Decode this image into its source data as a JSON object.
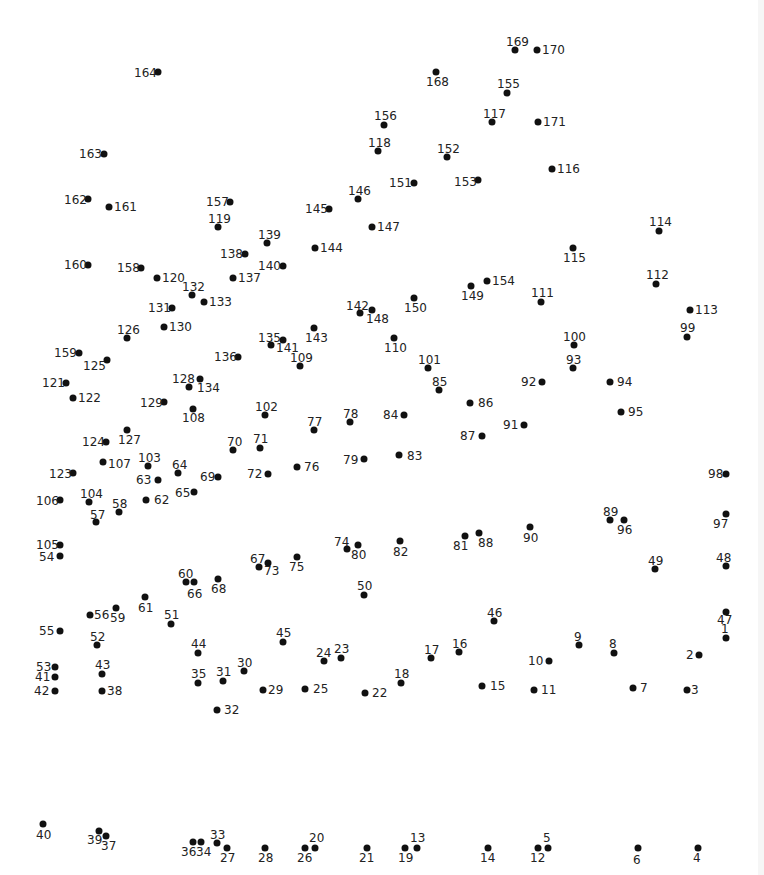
{
  "puzzle": {
    "type": "connect-the-dots",
    "dot_color": "#111111",
    "label_color": "#222222",
    "background": "#ffffff",
    "points": [
      {
        "n": "1",
        "x": 726,
        "y": 638,
        "lx": 721,
        "ly": 623
      },
      {
        "n": "2",
        "x": 699,
        "y": 655,
        "lx": 686,
        "ly": 649
      },
      {
        "n": "3",
        "x": 687,
        "y": 690,
        "lx": 691,
        "ly": 684
      },
      {
        "n": "4",
        "x": 698,
        "y": 848,
        "lx": 693,
        "ly": 852
      },
      {
        "n": "5",
        "x": 548,
        "y": 848,
        "lx": 543,
        "ly": 832
      },
      {
        "n": "6",
        "x": 638,
        "y": 848,
        "lx": 633,
        "ly": 854
      },
      {
        "n": "7",
        "x": 633,
        "y": 688,
        "lx": 640,
        "ly": 682
      },
      {
        "n": "8",
        "x": 614,
        "y": 653,
        "lx": 609,
        "ly": 638
      },
      {
        "n": "9",
        "x": 579,
        "y": 645,
        "lx": 574,
        "ly": 631
      },
      {
        "n": "10",
        "x": 549,
        "y": 661,
        "lx": 528,
        "ly": 655
      },
      {
        "n": "11",
        "x": 534,
        "y": 690,
        "lx": 541,
        "ly": 684
      },
      {
        "n": "12",
        "x": 538,
        "y": 848,
        "lx": 530,
        "ly": 852
      },
      {
        "n": "13",
        "x": 417,
        "y": 848,
        "lx": 410,
        "ly": 832
      },
      {
        "n": "14",
        "x": 488,
        "y": 848,
        "lx": 480,
        "ly": 852
      },
      {
        "n": "15",
        "x": 482,
        "y": 686,
        "lx": 490,
        "ly": 680
      },
      {
        "n": "16",
        "x": 459,
        "y": 652,
        "lx": 452,
        "ly": 638
      },
      {
        "n": "17",
        "x": 431,
        "y": 658,
        "lx": 424,
        "ly": 644
      },
      {
        "n": "18",
        "x": 401,
        "y": 683,
        "lx": 394,
        "ly": 668
      },
      {
        "n": "19",
        "x": 405,
        "y": 848,
        "lx": 398,
        "ly": 852
      },
      {
        "n": "20",
        "x": 315,
        "y": 848,
        "lx": 309,
        "ly": 832
      },
      {
        "n": "21",
        "x": 367,
        "y": 848,
        "lx": 359,
        "ly": 852
      },
      {
        "n": "22",
        "x": 365,
        "y": 693,
        "lx": 372,
        "ly": 687
      },
      {
        "n": "23",
        "x": 341,
        "y": 658,
        "lx": 334,
        "ly": 643
      },
      {
        "n": "24",
        "x": 324,
        "y": 661,
        "lx": 316,
        "ly": 647
      },
      {
        "n": "25",
        "x": 305,
        "y": 689,
        "lx": 313,
        "ly": 683
      },
      {
        "n": "26",
        "x": 305,
        "y": 848,
        "lx": 297,
        "ly": 852
      },
      {
        "n": "27",
        "x": 227,
        "y": 848,
        "lx": 220,
        "ly": 852
      },
      {
        "n": "28",
        "x": 265,
        "y": 848,
        "lx": 258,
        "ly": 852
      },
      {
        "n": "29",
        "x": 263,
        "y": 690,
        "lx": 268,
        "ly": 684
      },
      {
        "n": "30",
        "x": 244,
        "y": 671,
        "lx": 237,
        "ly": 657
      },
      {
        "n": "31",
        "x": 223,
        "y": 681,
        "lx": 216,
        "ly": 666
      },
      {
        "n": "32",
        "x": 217,
        "y": 710,
        "lx": 224,
        "ly": 704
      },
      {
        "n": "33",
        "x": 217,
        "y": 843,
        "lx": 210,
        "ly": 829
      },
      {
        "n": "34",
        "x": 201,
        "y": 842,
        "lx": 196,
        "ly": 846
      },
      {
        "n": "35",
        "x": 198,
        "y": 683,
        "lx": 191,
        "ly": 668
      },
      {
        "n": "36",
        "x": 193,
        "y": 842,
        "lx": 181,
        "ly": 846
      },
      {
        "n": "37",
        "x": 106,
        "y": 836,
        "lx": 101,
        "ly": 840
      },
      {
        "n": "38",
        "x": 102,
        "y": 691,
        "lx": 107,
        "ly": 685
      },
      {
        "n": "39",
        "x": 99,
        "y": 831,
        "lx": 87,
        "ly": 834
      },
      {
        "n": "40",
        "x": 43,
        "y": 824,
        "lx": 36,
        "ly": 829
      },
      {
        "n": "41",
        "x": 55,
        "y": 677,
        "lx": 35,
        "ly": 671
      },
      {
        "n": "42",
        "x": 55,
        "y": 691,
        "lx": 34,
        "ly": 685
      },
      {
        "n": "43",
        "x": 102,
        "y": 674,
        "lx": 95,
        "ly": 659
      },
      {
        "n": "44",
        "x": 198,
        "y": 653,
        "lx": 191,
        "ly": 638
      },
      {
        "n": "45",
        "x": 283,
        "y": 642,
        "lx": 276,
        "ly": 627
      },
      {
        "n": "46",
        "x": 494,
        "y": 621,
        "lx": 487,
        "ly": 607
      },
      {
        "n": "47",
        "x": 726,
        "y": 612,
        "lx": 717,
        "ly": 614
      },
      {
        "n": "48",
        "x": 726,
        "y": 566,
        "lx": 716,
        "ly": 552
      },
      {
        "n": "49",
        "x": 655,
        "y": 569,
        "lx": 648,
        "ly": 555
      },
      {
        "n": "50",
        "x": 364,
        "y": 595,
        "lx": 357,
        "ly": 580
      },
      {
        "n": "51",
        "x": 171,
        "y": 624,
        "lx": 164,
        "ly": 609
      },
      {
        "n": "52",
        "x": 97,
        "y": 645,
        "lx": 90,
        "ly": 631
      },
      {
        "n": "53",
        "x": 55,
        "y": 667,
        "lx": 36,
        "ly": 661
      },
      {
        "n": "54",
        "x": 60,
        "y": 556,
        "lx": 39,
        "ly": 551
      },
      {
        "n": "55",
        "x": 60,
        "y": 631,
        "lx": 39,
        "ly": 625
      },
      {
        "n": "56",
        "x": 90,
        "y": 615,
        "lx": 94,
        "ly": 609
      },
      {
        "n": "57",
        "x": 96,
        "y": 522,
        "lx": 90,
        "ly": 509
      },
      {
        "n": "58",
        "x": 119,
        "y": 512,
        "lx": 112,
        "ly": 498
      },
      {
        "n": "59",
        "x": 116,
        "y": 608,
        "lx": 110,
        "ly": 612
      },
      {
        "n": "60",
        "x": 186,
        "y": 582,
        "lx": 178,
        "ly": 568
      },
      {
        "n": "61",
        "x": 145,
        "y": 597,
        "lx": 138,
        "ly": 602
      },
      {
        "n": "62",
        "x": 146,
        "y": 500,
        "lx": 154,
        "ly": 494
      },
      {
        "n": "63",
        "x": 158,
        "y": 480,
        "lx": 136,
        "ly": 474
      },
      {
        "n": "64",
        "x": 178,
        "y": 473,
        "lx": 172,
        "ly": 459
      },
      {
        "n": "65",
        "x": 194,
        "y": 492,
        "lx": 175,
        "ly": 487
      },
      {
        "n": "66",
        "x": 194,
        "y": 582,
        "lx": 187,
        "ly": 588
      },
      {
        "n": "67",
        "x": 259,
        "y": 567,
        "lx": 250,
        "ly": 553
      },
      {
        "n": "68",
        "x": 218,
        "y": 579,
        "lx": 211,
        "ly": 583
      },
      {
        "n": "69",
        "x": 218,
        "y": 477,
        "lx": 200,
        "ly": 471
      },
      {
        "n": "70",
        "x": 233,
        "y": 450,
        "lx": 227,
        "ly": 436
      },
      {
        "n": "71",
        "x": 260,
        "y": 448,
        "lx": 253,
        "ly": 433
      },
      {
        "n": "72",
        "x": 268,
        "y": 474,
        "lx": 247,
        "ly": 468
      },
      {
        "n": "73",
        "x": 268,
        "y": 563,
        "lx": 264,
        "ly": 565
      },
      {
        "n": "74",
        "x": 347,
        "y": 549,
        "lx": 334,
        "ly": 536
      },
      {
        "n": "75",
        "x": 297,
        "y": 557,
        "lx": 289,
        "ly": 561
      },
      {
        "n": "76",
        "x": 297,
        "y": 467,
        "lx": 304,
        "ly": 461
      },
      {
        "n": "77",
        "x": 314,
        "y": 430,
        "lx": 307,
        "ly": 416
      },
      {
        "n": "78",
        "x": 350,
        "y": 422,
        "lx": 343,
        "ly": 408
      },
      {
        "n": "79",
        "x": 364,
        "y": 459,
        "lx": 343,
        "ly": 454
      },
      {
        "n": "80",
        "x": 358,
        "y": 545,
        "lx": 351,
        "ly": 549
      },
      {
        "n": "81",
        "x": 465,
        "y": 536,
        "lx": 453,
        "ly": 540
      },
      {
        "n": "82",
        "x": 400,
        "y": 541,
        "lx": 393,
        "ly": 546
      },
      {
        "n": "83",
        "x": 399,
        "y": 455,
        "lx": 407,
        "ly": 450
      },
      {
        "n": "84",
        "x": 404,
        "y": 415,
        "lx": 383,
        "ly": 409
      },
      {
        "n": "85",
        "x": 439,
        "y": 390,
        "lx": 432,
        "ly": 376
      },
      {
        "n": "86",
        "x": 470,
        "y": 403,
        "lx": 478,
        "ly": 397
      },
      {
        "n": "87",
        "x": 482,
        "y": 436,
        "lx": 460,
        "ly": 430
      },
      {
        "n": "88",
        "x": 479,
        "y": 533,
        "lx": 478,
        "ly": 537
      },
      {
        "n": "89",
        "x": 610,
        "y": 520,
        "lx": 603,
        "ly": 506
      },
      {
        "n": "90",
        "x": 530,
        "y": 527,
        "lx": 523,
        "ly": 532
      },
      {
        "n": "91",
        "x": 524,
        "y": 425,
        "lx": 503,
        "ly": 419
      },
      {
        "n": "92",
        "x": 542,
        "y": 382,
        "lx": 521,
        "ly": 376
      },
      {
        "n": "93",
        "x": 573,
        "y": 368,
        "lx": 566,
        "ly": 354
      },
      {
        "n": "94",
        "x": 610,
        "y": 382,
        "lx": 617,
        "ly": 376
      },
      {
        "n": "95",
        "x": 621,
        "y": 412,
        "lx": 628,
        "ly": 406
      },
      {
        "n": "96",
        "x": 624,
        "y": 520,
        "lx": 617,
        "ly": 524
      },
      {
        "n": "97",
        "x": 726,
        "y": 514,
        "lx": 713,
        "ly": 518
      },
      {
        "n": "98",
        "x": 726,
        "y": 474,
        "lx": 708,
        "ly": 468
      },
      {
        "n": "99",
        "x": 687,
        "y": 337,
        "lx": 680,
        "ly": 322
      },
      {
        "n": "100",
        "x": 574,
        "y": 345,
        "lx": 563,
        "ly": 331
      },
      {
        "n": "101",
        "x": 428,
        "y": 368,
        "lx": 418,
        "ly": 354
      },
      {
        "n": "102",
        "x": 265,
        "y": 415,
        "lx": 255,
        "ly": 401
      },
      {
        "n": "103",
        "x": 148,
        "y": 466,
        "lx": 138,
        "ly": 452
      },
      {
        "n": "104",
        "x": 89,
        "y": 502,
        "lx": 80,
        "ly": 488
      },
      {
        "n": "105",
        "x": 60,
        "y": 545,
        "lx": 36,
        "ly": 539
      },
      {
        "n": "106",
        "x": 60,
        "y": 500,
        "lx": 36,
        "ly": 495
      },
      {
        "n": "107",
        "x": 103,
        "y": 462,
        "lx": 108,
        "ly": 458
      },
      {
        "n": "108",
        "x": 193,
        "y": 409,
        "lx": 182,
        "ly": 412
      },
      {
        "n": "109",
        "x": 300,
        "y": 366,
        "lx": 290,
        "ly": 352
      },
      {
        "n": "110",
        "x": 394,
        "y": 338,
        "lx": 384,
        "ly": 342
      },
      {
        "n": "111",
        "x": 541,
        "y": 302,
        "lx": 531,
        "ly": 287
      },
      {
        "n": "112",
        "x": 656,
        "y": 284,
        "lx": 646,
        "ly": 269
      },
      {
        "n": "113",
        "x": 690,
        "y": 310,
        "lx": 695,
        "ly": 304
      },
      {
        "n": "114",
        "x": 659,
        "y": 231,
        "lx": 649,
        "ly": 216
      },
      {
        "n": "115",
        "x": 573,
        "y": 248,
        "lx": 563,
        "ly": 252
      },
      {
        "n": "116",
        "x": 552,
        "y": 169,
        "lx": 557,
        "ly": 163
      },
      {
        "n": "117",
        "x": 492,
        "y": 122,
        "lx": 483,
        "ly": 108
      },
      {
        "n": "118",
        "x": 378,
        "y": 151,
        "lx": 368,
        "ly": 137
      },
      {
        "n": "119",
        "x": 218,
        "y": 227,
        "lx": 208,
        "ly": 213
      },
      {
        "n": "120",
        "x": 157,
        "y": 278,
        "lx": 162,
        "ly": 272
      },
      {
        "n": "121",
        "x": 66,
        "y": 383,
        "lx": 42,
        "ly": 377
      },
      {
        "n": "122",
        "x": 73,
        "y": 398,
        "lx": 78,
        "ly": 392
      },
      {
        "n": "123",
        "x": 73,
        "y": 473,
        "lx": 49,
        "ly": 468
      },
      {
        "n": "124",
        "x": 106,
        "y": 442,
        "lx": 82,
        "ly": 436
      },
      {
        "n": "125",
        "x": 107,
        "y": 360,
        "lx": 83,
        "ly": 360
      },
      {
        "n": "126",
        "x": 127,
        "y": 338,
        "lx": 117,
        "ly": 324
      },
      {
        "n": "127",
        "x": 127,
        "y": 430,
        "lx": 118,
        "ly": 434
      },
      {
        "n": "128",
        "x": 200,
        "y": 379,
        "lx": 172,
        "ly": 373
      },
      {
        "n": "129",
        "x": 164,
        "y": 402,
        "lx": 140,
        "ly": 397
      },
      {
        "n": "130",
        "x": 164,
        "y": 327,
        "lx": 169,
        "ly": 321
      },
      {
        "n": "131",
        "x": 172,
        "y": 308,
        "lx": 148,
        "ly": 302
      },
      {
        "n": "132",
        "x": 192,
        "y": 295,
        "lx": 182,
        "ly": 281
      },
      {
        "n": "133",
        "x": 204,
        "y": 302,
        "lx": 209,
        "ly": 296
      },
      {
        "n": "134",
        "x": 189,
        "y": 387,
        "lx": 197,
        "ly": 382
      },
      {
        "n": "135",
        "x": 271,
        "y": 345,
        "lx": 258,
        "ly": 332
      },
      {
        "n": "136",
        "x": 238,
        "y": 357,
        "lx": 214,
        "ly": 351
      },
      {
        "n": "137",
        "x": 233,
        "y": 278,
        "lx": 238,
        "ly": 272
      },
      {
        "n": "138",
        "x": 245,
        "y": 254,
        "lx": 220,
        "ly": 248
      },
      {
        "n": "139",
        "x": 267,
        "y": 243,
        "lx": 258,
        "ly": 229
      },
      {
        "n": "140",
        "x": 283,
        "y": 266,
        "lx": 258,
        "ly": 260
      },
      {
        "n": "141",
        "x": 283,
        "y": 340,
        "lx": 276,
        "ly": 342
      },
      {
        "n": "142",
        "x": 360,
        "y": 313,
        "lx": 346,
        "ly": 300
      },
      {
        "n": "143",
        "x": 314,
        "y": 328,
        "lx": 305,
        "ly": 332
      },
      {
        "n": "144",
        "x": 315,
        "y": 248,
        "lx": 320,
        "ly": 242
      },
      {
        "n": "145",
        "x": 329,
        "y": 209,
        "lx": 305,
        "ly": 203
      },
      {
        "n": "146",
        "x": 358,
        "y": 199,
        "lx": 348,
        "ly": 185
      },
      {
        "n": "147",
        "x": 372,
        "y": 227,
        "lx": 377,
        "ly": 221
      },
      {
        "n": "148",
        "x": 372,
        "y": 310,
        "lx": 366,
        "ly": 313
      },
      {
        "n": "149",
        "x": 471,
        "y": 286,
        "lx": 461,
        "ly": 290
      },
      {
        "n": "150",
        "x": 414,
        "y": 298,
        "lx": 404,
        "ly": 302
      },
      {
        "n": "151",
        "x": 414,
        "y": 183,
        "lx": 389,
        "ly": 177
      },
      {
        "n": "152",
        "x": 447,
        "y": 157,
        "lx": 437,
        "ly": 143
      },
      {
        "n": "153",
        "x": 478,
        "y": 180,
        "lx": 454,
        "ly": 176
      },
      {
        "n": "154",
        "x": 487,
        "y": 281,
        "lx": 492,
        "ly": 275
      },
      {
        "n": "155",
        "x": 507,
        "y": 93,
        "lx": 497,
        "ly": 78
      },
      {
        "n": "156",
        "x": 384,
        "y": 125,
        "lx": 374,
        "ly": 110
      },
      {
        "n": "157",
        "x": 230,
        "y": 202,
        "lx": 206,
        "ly": 196
      },
      {
        "n": "158",
        "x": 141,
        "y": 268,
        "lx": 117,
        "ly": 262
      },
      {
        "n": "159",
        "x": 79,
        "y": 353,
        "lx": 54,
        "ly": 347
      },
      {
        "n": "160",
        "x": 88,
        "y": 265,
        "lx": 64,
        "ly": 259
      },
      {
        "n": "161",
        "x": 109,
        "y": 207,
        "lx": 114,
        "ly": 201
      },
      {
        "n": "162",
        "x": 88,
        "y": 199,
        "lx": 64,
        "ly": 194
      },
      {
        "n": "163",
        "x": 104,
        "y": 154,
        "lx": 79,
        "ly": 148
      },
      {
        "n": "164",
        "x": 158,
        "y": 72,
        "lx": 134,
        "ly": 67
      },
      {
        "n": "168",
        "x": 436,
        "y": 72,
        "lx": 426,
        "ly": 76
      },
      {
        "n": "169",
        "x": 515,
        "y": 50,
        "lx": 506,
        "ly": 36
      },
      {
        "n": "170",
        "x": 537,
        "y": 50,
        "lx": 542,
        "ly": 44
      },
      {
        "n": "171",
        "x": 538,
        "y": 122,
        "lx": 543,
        "ly": 116
      }
    ]
  }
}
